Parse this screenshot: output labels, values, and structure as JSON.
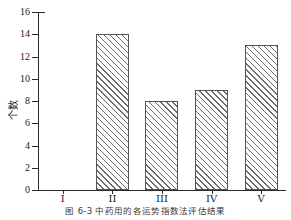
{
  "chart_data": {
    "type": "bar",
    "title": "",
    "xlabel": "",
    "ylabel": "个数",
    "categories": [
      "I",
      "II",
      "III",
      "IV",
      "V"
    ],
    "values": [
      0,
      14,
      8,
      9,
      13
    ],
    "ylim": [
      0,
      16
    ],
    "ytick_step": 2,
    "yticks": [
      0,
      2,
      4,
      6,
      8,
      10,
      12,
      14,
      16
    ],
    "ytick_labels": [
      "0",
      "2",
      "4",
      "6",
      "8",
      "10",
      "12",
      "14",
      "16"
    ],
    "grid": false,
    "legend": "none",
    "bar_fill": "diagonal-hatch",
    "bar_edge_color": "#555555",
    "axis_color": "#2b2b2b"
  },
  "caption": {
    "text": "图 6-3  中药用的各运势指数法评估结果"
  }
}
